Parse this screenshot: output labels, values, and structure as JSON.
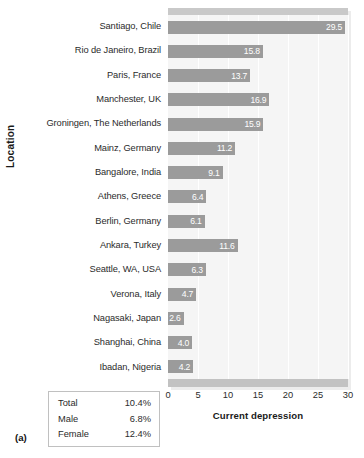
{
  "figure": {
    "panel_letter": "(a)",
    "bar_color": "#9b9b9b",
    "plot_background": "#f5f5f5",
    "band_color": "#c2c2c2"
  },
  "summary": {
    "rows": [
      {
        "label": "Total",
        "value": "10.4%"
      },
      {
        "label": "Male",
        "value": "6.8%"
      },
      {
        "label": "Female",
        "value": "12.4%"
      }
    ]
  },
  "chart_data": {
    "type": "bar",
    "orientation": "horizontal",
    "title": "",
    "xlabel": "Current depression",
    "ylabel": "Location",
    "xlim": [
      0,
      30
    ],
    "xticks": [
      0,
      5,
      10,
      15,
      20,
      25,
      30
    ],
    "xtick_labels": [
      "0",
      "5",
      "10",
      "15",
      "20",
      "25",
      "30"
    ],
    "grid": true,
    "legend": "none",
    "categories": [
      "Santiago, Chile",
      "Rio de Janeiro, Brazil",
      "Paris, France",
      "Manchester, UK",
      "Groningen, The Netherlands",
      "Mainz, Germany",
      "Bangalore, India",
      "Athens, Greece",
      "Berlin, Germany",
      "Ankara, Turkey",
      "Seattle, WA, USA",
      "Verona, Italy",
      "Nagasaki, Japan",
      "Shanghai, China",
      "Ibadan, Nigeria"
    ],
    "values": [
      29.5,
      15.8,
      13.7,
      16.9,
      15.9,
      11.2,
      9.1,
      6.4,
      6.1,
      11.6,
      6.3,
      4.7,
      2.6,
      4.0,
      4.2
    ],
    "value_labels": [
      "29.5",
      "15.8",
      "13.7",
      "16.9",
      "15.9",
      "11.2",
      "9.1",
      "6.4",
      "6.1",
      "11.6",
      "6.3",
      "4.7",
      "2.6",
      "4.0",
      "4.2"
    ]
  }
}
